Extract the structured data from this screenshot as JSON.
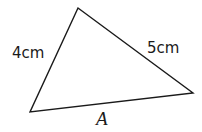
{
  "diagram": {
    "type": "triangle",
    "vertices": {
      "top": [
        78,
        8
      ],
      "bottom_left": [
        30,
        112
      ],
      "right": [
        193,
        93
      ]
    },
    "sides": [
      {
        "id": "left",
        "label": "4cm"
      },
      {
        "id": "right",
        "label": "5cm"
      },
      {
        "id": "bottom",
        "label": "A"
      }
    ],
    "stroke_color": "#1a1a1a"
  }
}
